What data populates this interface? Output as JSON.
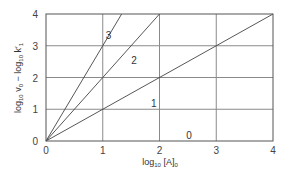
{
  "chart_data": {
    "type": "line",
    "title": "",
    "xlabel": "log10 [A]0",
    "ylabel": "log10 v0 − log10 k'1",
    "xlabel_parts": {
      "pre": "log",
      "sub1": "10",
      "mid": " [A]",
      "sub2": "0"
    },
    "ylabel_parts": {
      "pre": "log",
      "sub1": "10",
      "v": " v",
      "sub2": "0",
      "minus": " − log",
      "sub3": "10",
      "k": " k′",
      "sub4": "1"
    },
    "xlim": [
      0,
      4
    ],
    "ylim": [
      0,
      4
    ],
    "xticks": [
      0,
      1,
      2,
      3,
      4
    ],
    "yticks": [
      0,
      1,
      2,
      3,
      4
    ],
    "grid": true,
    "legend": "inline labels",
    "series": [
      {
        "name": "3",
        "slope": 3,
        "x": [
          0,
          1.333
        ],
        "y": [
          0,
          4
        ],
        "label_pos": [
          1.1,
          3.35
        ]
      },
      {
        "name": "2",
        "slope": 2,
        "x": [
          0,
          2
        ],
        "y": [
          0,
          4
        ],
        "label_pos": [
          1.55,
          2.55
        ]
      },
      {
        "name": "1",
        "slope": 1,
        "x": [
          0,
          4
        ],
        "y": [
          0,
          4
        ],
        "label_pos": [
          1.9,
          1.2
        ]
      },
      {
        "name": "0",
        "slope": 0,
        "x": [
          0,
          4
        ],
        "y": [
          0,
          0
        ],
        "label_pos": [
          2.52,
          0.18
        ]
      }
    ]
  },
  "colors": {
    "axis": "#555555",
    "grid": "#8a8a8a",
    "line": "#444444",
    "text": "#333333"
  }
}
